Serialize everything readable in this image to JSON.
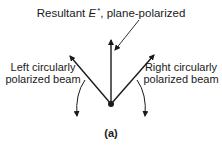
{
  "figure": {
    "title": {
      "prefix": "Resultant ",
      "symbol": "E",
      "superscript": "*",
      "suffix": ", plane-polarized"
    },
    "left_beam": {
      "line1": "Left circularly",
      "line2": "polarized beam",
      "rotation": "counterclockwise"
    },
    "right_beam": {
      "line1": "Right circularly",
      "line2": "polarized beam",
      "rotation": "clockwise"
    },
    "caption": "(a)",
    "colors": {
      "ink": "#1a1a1a",
      "background": "#ffffff"
    }
  }
}
